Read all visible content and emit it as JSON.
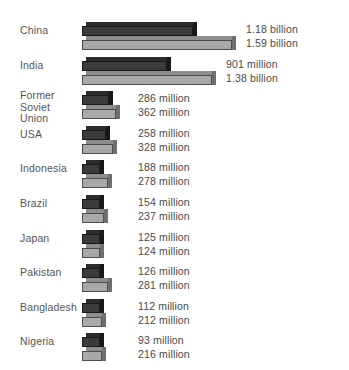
{
  "chart_data": {
    "type": "bar",
    "title": "",
    "subtitle": "",
    "xlabel": "",
    "ylabel": "",
    "orientation": "horizontal",
    "grid": false,
    "legend_position": "none",
    "axis_visible": false,
    "unit_note": "Dark bar = current population; light bar = projected population",
    "categories": [
      "China",
      "India",
      "Former\nSoviet Union",
      "USA",
      "Indonesia",
      "Brazil",
      "Japan",
      "Pakistan",
      "Bangladesh",
      "Nigeria"
    ],
    "series": [
      {
        "name": "current",
        "color": "#3b3b3b",
        "values": [
          1180,
          901,
          286,
          258,
          188,
          154,
          125,
          126,
          112,
          93
        ],
        "labels": [
          "1.18 billion",
          "901 million",
          "286 million",
          "258 million",
          "188 million",
          "154 million",
          "125 million",
          "126 million",
          "112 million",
          "93 million"
        ]
      },
      {
        "name": "projected",
        "color": "#a9a9a9",
        "values": [
          1590,
          1380,
          362,
          328,
          278,
          237,
          124,
          281,
          212,
          216
        ],
        "labels": [
          "1.59 billion",
          "1.38 billion",
          "362 million",
          "328 million",
          "278 million",
          "237 million",
          "124 million",
          "281 million",
          "212 million",
          "216 million"
        ]
      }
    ],
    "value_unit": "millions",
    "xlim": [
      0,
      1590
    ]
  },
  "colors": {
    "background": "#ffffff",
    "dark_bar": "#3b3b3b",
    "dark_bar_top": "#2c2c2c",
    "dark_bar_side": "#181818",
    "light_bar": "#a9a9a9",
    "light_bar_top": "#8d8d8d",
    "light_bar_side": "#6f6f6f",
    "text": "#4a4a4a"
  },
  "rows": [
    {
      "label": "China",
      "dark_label": "1.18 billion",
      "light_label": "1.59 billion",
      "dark_value": 1180,
      "light_value": 1590
    },
    {
      "label": "India",
      "dark_label": "901 million",
      "light_label": "1.38 billion",
      "dark_value": 901,
      "light_value": 1380
    },
    {
      "label": "Former\nSoviet Union",
      "dark_label": "286 million",
      "light_label": "362 million",
      "dark_value": 286,
      "light_value": 362
    },
    {
      "label": "USA",
      "dark_label": "258 million",
      "light_label": "328 million",
      "dark_value": 258,
      "light_value": 328
    },
    {
      "label": "Indonesia",
      "dark_label": "188 million",
      "light_label": "278 million",
      "dark_value": 188,
      "light_value": 278
    },
    {
      "label": "Brazil",
      "dark_label": "154 million",
      "light_label": "237 million",
      "dark_value": 154,
      "light_value": 237
    },
    {
      "label": "Japan",
      "dark_label": "125 million",
      "light_label": "124 million",
      "dark_value": 125,
      "light_value": 124
    },
    {
      "label": "Pakistan",
      "dark_label": "126 million",
      "light_label": "281 million",
      "dark_value": 126,
      "light_value": 281
    },
    {
      "label": "Bangladesh",
      "dark_label": "112 million",
      "light_label": "212 million",
      "dark_value": 112,
      "light_value": 212
    },
    {
      "label": "Nigeria",
      "dark_label": "93 million",
      "light_label": "216 million",
      "dark_value": 93,
      "light_value": 216
    }
  ],
  "layout": {
    "bar_origin_x": 82,
    "row_top_start": 22,
    "row_spacing": 34.6,
    "px_per_million": 0.0943,
    "min_bar_px": 18,
    "value_gap_px": 10,
    "value_min_x": 138
  }
}
